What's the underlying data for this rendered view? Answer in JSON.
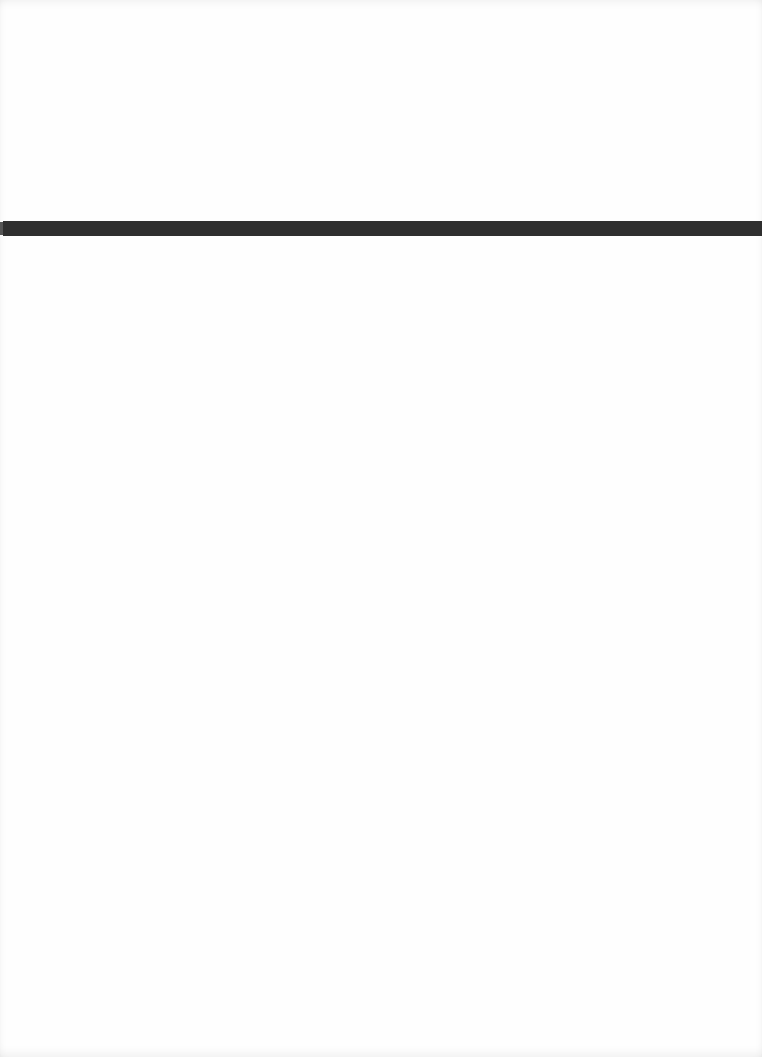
{
  "document": {
    "type": "scanned-page",
    "background_color": "#fefefe",
    "elements": [
      {
        "kind": "horizontal-rule",
        "color": "#2f2f2f",
        "top_px": 221,
        "height_px": 15
      }
    ],
    "text": ""
  }
}
